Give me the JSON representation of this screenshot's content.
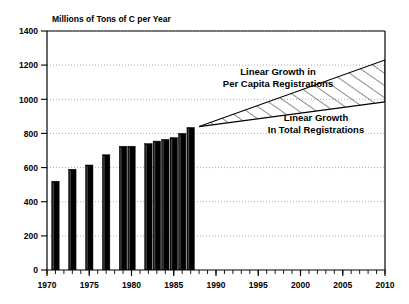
{
  "chart_data": {
    "type": "bar",
    "title": "Millions of Tons of C per Year",
    "xlabel": "",
    "ylabel": "Millions of Tons of C per Year",
    "xlim": [
      1970,
      2010
    ],
    "ylim": [
      0,
      1400
    ],
    "ytick_step": 200,
    "yticks": [
      0,
      200,
      400,
      600,
      800,
      1000,
      1200,
      1400
    ],
    "ytick_labels": [
      "0",
      "200",
      "400",
      "600",
      "800",
      "1000",
      "1200",
      "1400"
    ],
    "xticks": [
      1970,
      1975,
      1980,
      1985,
      1990,
      1995,
      2000,
      2005,
      2010
    ],
    "xtick_labels": [
      "1970",
      "1975",
      "1980",
      "1985",
      "1990",
      "1995",
      "2000",
      "2005",
      "2010"
    ],
    "x_minor_tick_step": 1,
    "grid": "horizontal-dotted",
    "legend": "none",
    "bar_color": "#000000",
    "categories": [
      1971,
      1973,
      1975,
      1977,
      1979,
      1980,
      1982,
      1983,
      1984,
      1985,
      1986,
      1987
    ],
    "values": [
      520,
      590,
      615,
      675,
      725,
      725,
      740,
      755,
      765,
      775,
      800,
      835
    ],
    "series": [
      {
        "name": "Historical Emissions",
        "type": "bar",
        "x": [
          1971,
          1973,
          1975,
          1977,
          1979,
          1980,
          1982,
          1983,
          1984,
          1985,
          1986,
          1987
        ],
        "values": [
          520,
          590,
          615,
          675,
          725,
          725,
          740,
          755,
          765,
          775,
          800,
          835
        ]
      },
      {
        "name": "Linear Growth in Per Capita Registrations",
        "type": "line",
        "x": [
          1988,
          2010
        ],
        "values": [
          840,
          1230
        ]
      },
      {
        "name": "Linear Growth In Total Registrations",
        "type": "line",
        "x": [
          1988,
          2010
        ],
        "values": [
          840,
          985
        ]
      }
    ],
    "shaded_region": {
      "fill": "diagonal-hatch",
      "between": [
        "Linear Growth in Per Capita Registrations",
        "Linear Growth In Total Registrations"
      ],
      "x_start": 1988,
      "x_end": 2010
    },
    "annotations": [
      {
        "id": "per-capita",
        "lines": [
          "Linear Growth in",
          "Per Capita Registrations"
        ],
        "line1": "Linear Growth in",
        "line2": "Per Capita Registrations"
      },
      {
        "id": "total",
        "lines": [
          "Linear Growth",
          "In Total Registrations"
        ],
        "line1": "Linear Growth",
        "line2": "In Total Registrations"
      }
    ]
  },
  "colors": {
    "bar": "#000000",
    "axis": "#000000",
    "grid": "#999999",
    "background": "#ffffff"
  }
}
